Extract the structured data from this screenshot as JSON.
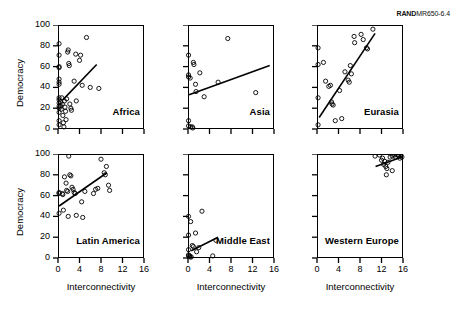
{
  "figure": {
    "doc_code_brand": "RAND",
    "doc_code_rest": "MR650-6.4",
    "xlabel": "Interconnectivity",
    "ylabel": "Democracy",
    "xticks": [
      "0",
      "4",
      "8",
      "12",
      "16"
    ],
    "yticks": [
      "0",
      "20",
      "40",
      "60",
      "80",
      "100"
    ],
    "marker_color": "#000000",
    "line_color": "#000000",
    "axis_color": "#000000",
    "background": "#ffffff"
  },
  "chart_data": {
    "type": "scatter",
    "title": "",
    "xlabel": "Interconnectivity",
    "ylabel": "Democracy",
    "xlim": [
      0,
      16
    ],
    "ylim": [
      0,
      100
    ],
    "xticks": [
      0,
      4,
      8,
      12,
      16
    ],
    "yticks": [
      0,
      20,
      40,
      60,
      80,
      100
    ],
    "grid": false,
    "legend": "none",
    "layout": "2 rows x 3 columns of small-multiple scatter panels, each with a fitted trend line",
    "panels": [
      {
        "label": "Africa",
        "row": 0,
        "col": 0,
        "points": [
          [
            0.2,
            82
          ],
          [
            0.2,
            71
          ],
          [
            0.2,
            60
          ],
          [
            0.2,
            59
          ],
          [
            0.2,
            48
          ],
          [
            0.2,
            45
          ],
          [
            0.2,
            43
          ],
          [
            0.2,
            30
          ],
          [
            0.2,
            28
          ],
          [
            0.2,
            25
          ],
          [
            0.2,
            22
          ],
          [
            0.2,
            20
          ],
          [
            0.2,
            16
          ],
          [
            0.2,
            8
          ],
          [
            0.2,
            4
          ],
          [
            0.5,
            26
          ],
          [
            0.5,
            22
          ],
          [
            0.6,
            19
          ],
          [
            0.7,
            30
          ],
          [
            0.8,
            24
          ],
          [
            0.9,
            13
          ],
          [
            1.0,
            6
          ],
          [
            1.1,
            2
          ],
          [
            1.2,
            27
          ],
          [
            1.3,
            21
          ],
          [
            1.4,
            17
          ],
          [
            1.5,
            9
          ],
          [
            1.6,
            29
          ],
          [
            1.8,
            74
          ],
          [
            1.9,
            76
          ],
          [
            2.0,
            63
          ],
          [
            2.1,
            61
          ],
          [
            2.2,
            24
          ],
          [
            2.4,
            20
          ],
          [
            2.5,
            18
          ],
          [
            3.0,
            46
          ],
          [
            3.3,
            72
          ],
          [
            3.4,
            27
          ],
          [
            4.0,
            66
          ],
          [
            4.2,
            71
          ],
          [
            4.5,
            42
          ],
          [
            5.3,
            88
          ],
          [
            6.0,
            40
          ],
          [
            7.6,
            39
          ]
        ],
        "trend_line": {
          "x0": 0.9,
          "y0": 28,
          "x1": 7.2,
          "y1": 62
        }
      },
      {
        "label": "Asia",
        "row": 0,
        "col": 1,
        "points": [
          [
            0.1,
            71
          ],
          [
            0.1,
            52
          ],
          [
            0.1,
            50
          ],
          [
            0.1,
            8
          ],
          [
            0.1,
            3
          ],
          [
            0.4,
            49
          ],
          [
            0.5,
            2
          ],
          [
            0.8,
            2
          ],
          [
            0.9,
            1
          ],
          [
            1.0,
            64
          ],
          [
            1.1,
            62
          ],
          [
            1.4,
            43
          ],
          [
            1.5,
            36
          ],
          [
            2.2,
            54
          ],
          [
            3.0,
            31
          ],
          [
            5.6,
            45
          ],
          [
            7.4,
            87
          ],
          [
            12.6,
            35
          ]
        ],
        "trend_line": {
          "x0": 0.2,
          "y0": 33,
          "x1": 15.2,
          "y1": 61
        }
      },
      {
        "label": "Eurasia",
        "row": 0,
        "col": 2,
        "points": [
          [
            0.2,
            78
          ],
          [
            0.2,
            62
          ],
          [
            0.2,
            30
          ],
          [
            0.2,
            4
          ],
          [
            1.2,
            64
          ],
          [
            1.6,
            46
          ],
          [
            2.2,
            41
          ],
          [
            2.5,
            42
          ],
          [
            2.7,
            26
          ],
          [
            2.8,
            24
          ],
          [
            3.0,
            23
          ],
          [
            3.4,
            8
          ],
          [
            4.2,
            37
          ],
          [
            4.6,
            10
          ],
          [
            5.2,
            55
          ],
          [
            5.8,
            47
          ],
          [
            6.0,
            45
          ],
          [
            6.2,
            61
          ],
          [
            6.4,
            53
          ],
          [
            6.9,
            89
          ],
          [
            7.0,
            83
          ],
          [
            8.2,
            91
          ],
          [
            8.6,
            86
          ],
          [
            9.2,
            78
          ],
          [
            9.4,
            77
          ],
          [
            10.4,
            96
          ]
        ],
        "trend_line": {
          "x0": 0.4,
          "y0": 11,
          "x1": 10.8,
          "y1": 92
        }
      },
      {
        "label": "Latin America",
        "row": 1,
        "col": 0,
        "points": [
          [
            0.2,
            63
          ],
          [
            0.2,
            62
          ],
          [
            0.2,
            43
          ],
          [
            0.8,
            62
          ],
          [
            0.9,
            61
          ],
          [
            1.0,
            46
          ],
          [
            1.2,
            78
          ],
          [
            1.5,
            72
          ],
          [
            1.6,
            65
          ],
          [
            1.8,
            64
          ],
          [
            1.9,
            40
          ],
          [
            2.0,
            98
          ],
          [
            2.2,
            80
          ],
          [
            2.4,
            79
          ],
          [
            2.6,
            68
          ],
          [
            2.8,
            66
          ],
          [
            3.0,
            63
          ],
          [
            3.2,
            62
          ],
          [
            3.4,
            41
          ],
          [
            4.4,
            54
          ],
          [
            4.6,
            39
          ],
          [
            5.0,
            64
          ],
          [
            6.6,
            62
          ],
          [
            7.0,
            66
          ],
          [
            7.4,
            67
          ],
          [
            8.0,
            95
          ],
          [
            8.6,
            82
          ],
          [
            8.8,
            80
          ],
          [
            9.0,
            88
          ],
          [
            9.4,
            70
          ],
          [
            9.6,
            65
          ]
        ],
        "trend_line": {
          "x0": 0.2,
          "y0": 50,
          "x1": 9.1,
          "y1": 82
        }
      },
      {
        "label": "Middle East",
        "row": 1,
        "col": 1,
        "points": [
          [
            0.1,
            40
          ],
          [
            0.1,
            22
          ],
          [
            0.1,
            8
          ],
          [
            0.1,
            3
          ],
          [
            0.1,
            2
          ],
          [
            0.3,
            2
          ],
          [
            0.4,
            1
          ],
          [
            0.5,
            35
          ],
          [
            0.6,
            1
          ],
          [
            0.8,
            12
          ],
          [
            1.0,
            11
          ],
          [
            1.4,
            24
          ],
          [
            1.6,
            6
          ],
          [
            2.0,
            10
          ],
          [
            2.6,
            45
          ],
          [
            4.6,
            2
          ],
          [
            5.2,
            17
          ]
        ],
        "trend_line": {
          "x0": 0.6,
          "y0": 7,
          "x1": 5.6,
          "y1": 20
        }
      },
      {
        "label": "Western Europe",
        "row": 1,
        "col": 2,
        "points": [
          [
            10.8,
            98
          ],
          [
            11.6,
            99
          ],
          [
            12.0,
            94
          ],
          [
            12.2,
            96
          ],
          [
            12.4,
            90
          ],
          [
            12.6,
            93
          ],
          [
            12.8,
            88
          ],
          [
            13.0,
            86
          ],
          [
            13.2,
            92
          ],
          [
            13.6,
            97
          ],
          [
            14.0,
            98
          ],
          [
            14.4,
            99
          ],
          [
            14.6,
            97
          ],
          [
            15.0,
            99
          ],
          [
            15.2,
            98
          ],
          [
            15.4,
            96
          ],
          [
            15.6,
            99
          ],
          [
            15.8,
            97
          ],
          [
            12.9,
            80
          ],
          [
            14.0,
            84
          ]
        ],
        "trend_line": {
          "x0": 10.9,
          "y0": 88,
          "x1": 15.8,
          "y1": 97
        }
      }
    ]
  }
}
